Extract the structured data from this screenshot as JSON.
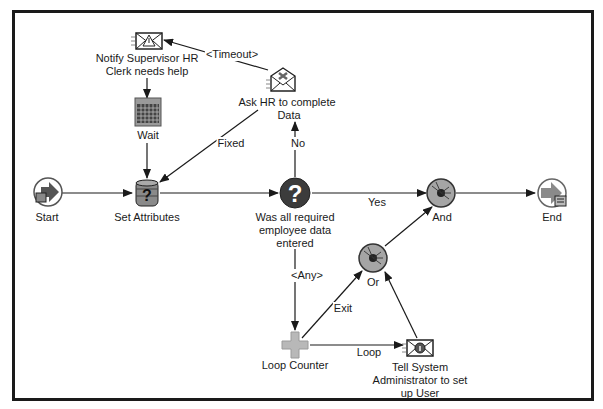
{
  "diagram": {
    "type": "workflow-process",
    "nodes": {
      "start": {
        "label": "Start"
      },
      "set_attributes": {
        "label": "Set Attributes"
      },
      "notify_supervisor": {
        "label_line1": "Notify Supervisor HR",
        "label_line2": "Clerk needs help"
      },
      "wait": {
        "label": "Wait"
      },
      "ask_hr": {
        "label_line1": "Ask HR to complete",
        "label_line2": "Data"
      },
      "decision": {
        "label_line1": "Was all required",
        "label_line2": "employee data",
        "label_line3": "entered"
      },
      "and": {
        "label": "And"
      },
      "or": {
        "label": "Or"
      },
      "end": {
        "label": "End"
      },
      "loop_counter": {
        "label": "Loop Counter"
      },
      "tell_admin": {
        "label_line1": "Tell System",
        "label_line2": "Administrator to set",
        "label_line3": "up User"
      }
    },
    "edges": {
      "timeout": "<Timeout>",
      "fixed": "Fixed",
      "no": "No",
      "yes": "Yes",
      "any": "<Any>",
      "exit": "Exit",
      "loop": "Loop"
    },
    "colors": {
      "frame": "#1a1a1a",
      "line": "#1a1a1a",
      "icon_gray": "#9a9a9a",
      "icon_dark": "#3a3a3a",
      "decision_fill": "#3c3c3c",
      "loop_cross": "#b8b8b8"
    }
  }
}
